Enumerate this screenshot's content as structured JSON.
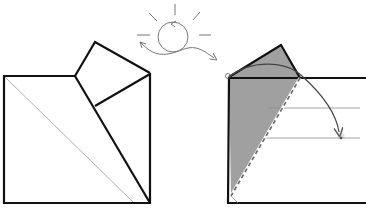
{
  "diagram": {
    "type": "origami-fold-instruction",
    "colors": {
      "stroke": "#111111",
      "thin_line": "#9a9a9a",
      "shade": "#8f8f8f",
      "sun": "#7a7a7a",
      "background": "#ffffff"
    },
    "icons": {
      "turn_over": "sun-rotate-icon",
      "fold_arrow": "curved-arrow-icon"
    },
    "panels": [
      {
        "id": "left",
        "label": "folded result",
        "shapes": [
          "square-base",
          "triangular-flap",
          "diagonal-crease"
        ]
      },
      {
        "id": "right",
        "label": "fold step",
        "shapes": [
          "rectangle-base",
          "shaded-triangle",
          "dashed-valley-fold",
          "fold-arrow",
          "reference-lines"
        ]
      }
    ],
    "annotations": {
      "fold_line_style": "dashed",
      "arrow_direction": "clockwise-down-right"
    }
  }
}
